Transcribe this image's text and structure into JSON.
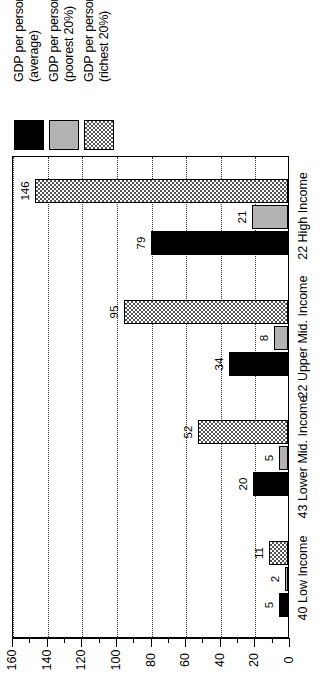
{
  "legend": {
    "position": "top-left",
    "entries": [
      {
        "label_line1": "GDP per person",
        "label_line2": "(average)",
        "swatch": "solid-black-swatch"
      },
      {
        "label_line1": "GDP per person",
        "label_line2": "(poorest 20%)",
        "swatch": "solid-gray-swatch"
      },
      {
        "label_line1": "GDP per person",
        "label_line2": "(richest 20%)",
        "swatch": "checkered-swatch"
      }
    ]
  },
  "chart_data": {
    "type": "bar",
    "orientation": "horizontal-rotated",
    "title": "",
    "xlabel": "",
    "ylabel": "",
    "ylim": [
      0,
      160
    ],
    "grid": true,
    "categories": [
      "40 Low Income",
      "43 Lower Mid. Income",
      "22 Upper Mid. Income",
      "22 High Income"
    ],
    "series": [
      {
        "name": "GDP per person (average)",
        "values": [
          5,
          20,
          34,
          79
        ]
      },
      {
        "name": "GDP per person (poorest 20%)",
        "values": [
          2,
          5,
          8,
          21
        ]
      },
      {
        "name": "GDP per person (richest 20%)",
        "values": [
          11,
          52,
          95,
          146
        ]
      }
    ],
    "tick_labels": [
      "0",
      "20",
      "40",
      "60",
      "80",
      "100",
      "120",
      "140",
      "160"
    ],
    "tick_values": [
      0,
      20,
      40,
      60,
      80,
      100,
      120,
      140,
      160
    ],
    "minor_tick_step": 10,
    "colors": {
      "average": "#000000",
      "poorest": "#b3b3b3",
      "richest": "#555555"
    }
  }
}
